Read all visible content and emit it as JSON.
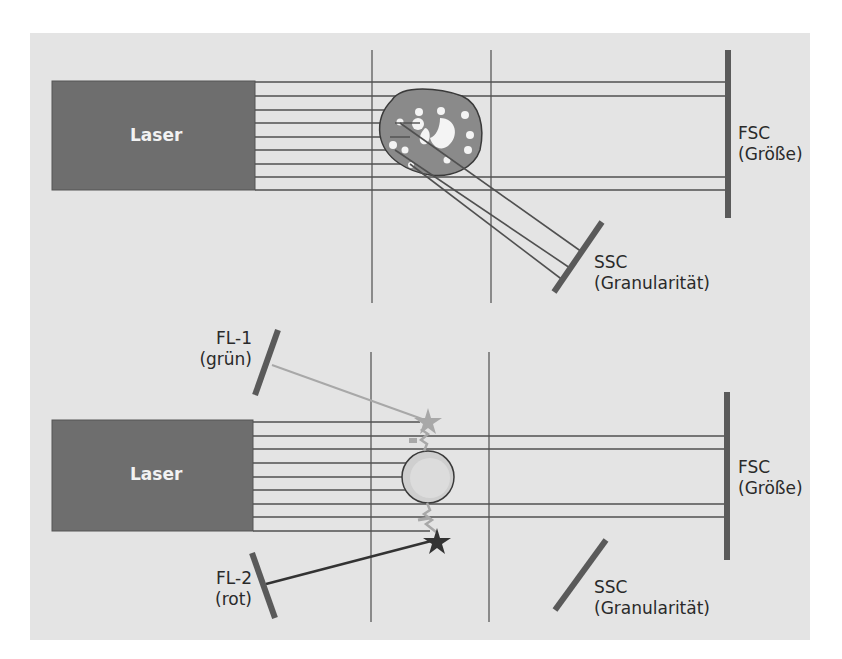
{
  "colors": {
    "background_panel": "#e4e4e4",
    "laser_box": "#6e6e6e",
    "beam_line": "#505050",
    "frame_line": "#8a8a8a",
    "detector": "#5a5a5a",
    "cell_fill": "#8a8a8a",
    "cell_granule": "#f4f4f4",
    "fluor_cell_fill": "#cfcfcf",
    "green_signal": "#a8a8a8",
    "red_signal": "#333333"
  },
  "top_panel": {
    "laser_label": "Laser",
    "fsc_label_line1": "FSC",
    "fsc_label_line2": "(Größe)",
    "ssc_label_line1": "SSC",
    "ssc_label_line2": "(Granularität)"
  },
  "bottom_panel": {
    "laser_label": "Laser",
    "fl1_label_line1": "FL-1",
    "fl1_label_line2": "(grün)",
    "fl2_label_line1": "FL-2",
    "fl2_label_line2": "(rot)",
    "fsc_label_line1": "FSC",
    "fsc_label_line2": "(Größe)",
    "ssc_label_line1": "SSC",
    "ssc_label_line2": "(Granularität)"
  },
  "icons": {
    "cell_granular": "granular-cell-icon",
    "cell_labeled": "antibody-labeled-cell-icon",
    "fluor_green": "star-icon",
    "fluor_red": "star-icon"
  }
}
